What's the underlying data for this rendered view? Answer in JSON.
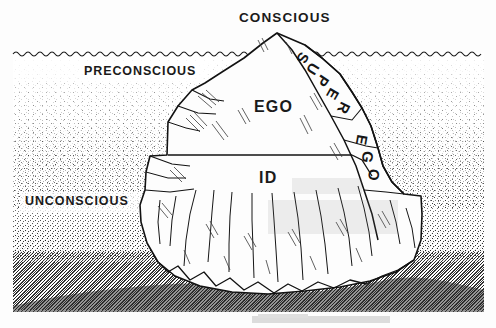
{
  "figure": {
    "type": "freud-iceberg-diagram",
    "background_color": "#fdfdfd",
    "ink_color": "#141414",
    "water_color": "#9a9a9a"
  },
  "labels": {
    "conscious": "CONSCIOUS",
    "preconscious": "PRECONSCIOUS",
    "unconscious": "UNCONSCIOUS",
    "ego": "EGO",
    "id": "ID",
    "super_ego": "SUPER EGO"
  },
  "super_ego_letters": [
    {
      "char": "S",
      "x": 303,
      "y": 58,
      "rot": 118
    },
    {
      "char": "U",
      "x": 313,
      "y": 69,
      "rot": 122
    },
    {
      "char": "P",
      "x": 323,
      "y": 81,
      "rot": 124
    },
    {
      "char": "E",
      "x": 333,
      "y": 94,
      "rot": 120
    },
    {
      "char": "R",
      "x": 344,
      "y": 108,
      "rot": 116
    },
    {
      "char": "E",
      "x": 362,
      "y": 140,
      "rot": 100
    },
    {
      "char": "G",
      "x": 368,
      "y": 157,
      "rot": 98
    },
    {
      "char": "O",
      "x": 374,
      "y": 175,
      "rot": 96
    }
  ],
  "regions": {
    "above_water": "CONSCIOUS",
    "just_below_water": "PRECONSCIOUS",
    "deep_water": "UNCONSCIOUS",
    "upper_berg": "EGO",
    "lower_berg": "ID",
    "right_ridge": "SUPER EGO"
  },
  "geometry": {
    "waterline_y": 53,
    "peak": {
      "x": 277,
      "y": 33
    },
    "ego_id_divider_y": 155,
    "seabed_top_y": 250,
    "frame": {
      "left": 13,
      "right": 484,
      "top": 52,
      "bottom": 312
    }
  }
}
